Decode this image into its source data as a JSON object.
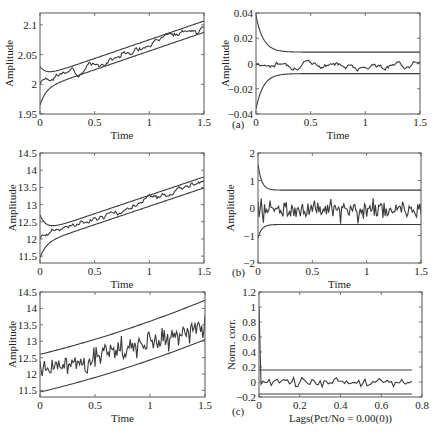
{
  "chart_data": [
    {
      "id": "a-left",
      "type": "line",
      "panel_label": "",
      "xlabel": "Time",
      "ylabel": "Amplitude",
      "xlim": [
        0,
        1.5
      ],
      "ylim": [
        1.95,
        2.12
      ],
      "xticks": [
        0,
        0.5,
        1,
        1.5
      ],
      "xtick_labels": [
        "0",
        "0.5",
        "1",
        "1.5"
      ],
      "yticks": [
        1.95,
        2,
        2.05,
        2.1
      ],
      "ytick_labels": [
        "1.95",
        "2",
        "2.05",
        "2.1"
      ],
      "grid": false,
      "frame": {
        "x": 40,
        "y": 13,
        "w": 164,
        "h": 101
      },
      "series": [
        {
          "name": "upper bound",
          "kind": "bound_upper",
          "start": 2.03,
          "min": 2.017,
          "slope": 0.063,
          "base": 2.012,
          "decay": 18
        },
        {
          "name": "estimate",
          "kind": "trend_noise",
          "start": 2.0,
          "base": 2.003,
          "slope": 0.063,
          "noise": 0.003,
          "seed": 3,
          "n": 150
        },
        {
          "name": "lower bound",
          "kind": "bound_lower",
          "start": 1.965,
          "base": 1.993,
          "slope": 0.063,
          "decay": 18
        }
      ]
    },
    {
      "id": "a-right",
      "type": "line",
      "panel_label": "(a)",
      "xlabel": "Time",
      "ylabel": "Amplitude",
      "xlim": [
        0,
        1.5
      ],
      "ylim": [
        -0.04,
        0.04
      ],
      "xticks": [
        0,
        0.5,
        1,
        1.5
      ],
      "xtick_labels": [
        "0",
        "0.5",
        "1",
        "1.5"
      ],
      "yticks": [
        -0.04,
        -0.02,
        0,
        0.02,
        0.04
      ],
      "ytick_labels": [
        "-0.04",
        "-0.02",
        "0",
        "0.02",
        "0.04"
      ],
      "grid": false,
      "frame": {
        "x": 256,
        "y": 13,
        "w": 164,
        "h": 101
      },
      "series": [
        {
          "name": "upper bound",
          "kind": "bound_upper",
          "start": 0.038,
          "base": 0.009,
          "slope": 0,
          "decay": 15
        },
        {
          "name": "residual",
          "kind": "walk",
          "base": 0.0,
          "slope": 0,
          "noise": 0.0012,
          "seed": 7,
          "n": 150,
          "clip": 0.006
        },
        {
          "name": "lower bound",
          "kind": "bound_lower",
          "start": -0.036,
          "base": -0.008,
          "slope": 0,
          "decay": 15
        }
      ]
    },
    {
      "id": "b-left",
      "type": "line",
      "panel_label": "",
      "xlabel": "Time",
      "ylabel": "Amplitude",
      "xlim": [
        0,
        1.5
      ],
      "ylim": [
        11.3,
        14.5
      ],
      "xticks": [
        0,
        0.5,
        1,
        1.5
      ],
      "xtick_labels": [
        "0",
        "0.5",
        "1",
        "1.5"
      ],
      "yticks": [
        11.5,
        12,
        12.5,
        13,
        13.5,
        14,
        14.5
      ],
      "ytick_labels": [
        "11.5",
        "12",
        "12.5",
        "13",
        "13.5",
        "14",
        "14.5"
      ],
      "grid": false,
      "frame": {
        "x": 40,
        "y": 153,
        "w": 164,
        "h": 110
      },
      "series": [
        {
          "name": "upper bound",
          "kind": "bound_upper",
          "start": 12.7,
          "base": 12.2,
          "slope": 1.07,
          "decay": 18
        },
        {
          "name": "estimate",
          "kind": "trend_noise",
          "start": 12.0,
          "base": 12.07,
          "slope": 1.05,
          "noise": 0.05,
          "seed": 11,
          "n": 150
        },
        {
          "name": "lower bound",
          "kind": "bound_lower",
          "start": 11.45,
          "base": 11.88,
          "slope": 1.07,
          "decay": 18
        }
      ]
    },
    {
      "id": "b-right",
      "type": "line",
      "panel_label": "(b)",
      "xlabel": "Time",
      "ylabel": "Amplitude",
      "xlim": [
        0,
        1.5
      ],
      "ylim": [
        -2,
        2
      ],
      "xticks": [
        0,
        0.5,
        1,
        1.5
      ],
      "xtick_labels": [
        "0",
        "0.5",
        "1",
        "1.5"
      ],
      "yticks": [
        -2,
        -1,
        0,
        1,
        2
      ],
      "ytick_labels": [
        "-2",
        "-1",
        "0",
        "1",
        "2"
      ],
      "grid": false,
      "frame": {
        "x": 258,
        "y": 153,
        "w": 163,
        "h": 110
      },
      "series": [
        {
          "name": "upper bound",
          "kind": "bound_upper",
          "start": 1.6,
          "base": 0.65,
          "slope": 0,
          "decay": 30
        },
        {
          "name": "residual",
          "kind": "white",
          "base": -0.05,
          "slope": 0,
          "noise": 0.28,
          "seed": 19,
          "n": 150
        },
        {
          "name": "lower bound",
          "kind": "bound_lower",
          "start": -1.1,
          "base": -0.6,
          "slope": 0,
          "decay": 30
        }
      ]
    },
    {
      "id": "c-left",
      "type": "line",
      "panel_label": "",
      "xlabel": "Time",
      "ylabel": "Amplitude",
      "xlim": [
        0,
        1.5
      ],
      "ylim": [
        11.3,
        14.5
      ],
      "xticks": [
        0,
        0.5,
        1,
        1.5
      ],
      "xtick_labels": [
        "0",
        "0.5",
        "1",
        "1.5"
      ],
      "yticks": [
        11.5,
        12,
        12.5,
        13,
        13.5,
        14,
        14.5
      ],
      "ytick_labels": [
        "11.5",
        "12",
        "12.5",
        "13",
        "13.5",
        "14",
        "14.5"
      ],
      "grid": false,
      "frame": {
        "x": 40,
        "y": 292,
        "w": 165,
        "h": 105
      },
      "series": [
        {
          "name": "upper bound",
          "kind": "line",
          "y0": 12.6,
          "y1": 14.25,
          "curve": 0.25
        },
        {
          "name": "measured",
          "kind": "trend_noise_white",
          "base": 12.05,
          "slope": 0.95,
          "noise": 0.27,
          "seed": 23,
          "n": 150
        },
        {
          "name": "lower bound",
          "kind": "line",
          "y0": 11.45,
          "y1": 13.05,
          "curve": 0.25
        }
      ]
    },
    {
      "id": "c-right",
      "type": "line",
      "panel_label": "(c)",
      "xlabel": "Lags(Pct/No = 0.00(0))",
      "ylabel": "Norm. corr.",
      "xlim": [
        0,
        0.8
      ],
      "ylim": [
        -0.2,
        1.2
      ],
      "xticks": [
        0,
        0.2,
        0.4,
        0.6,
        0.8
      ],
      "xtick_labels": [
        "0",
        "0.2",
        "0.4",
        "0.6",
        "0.8"
      ],
      "yticks": [
        -0.2,
        0,
        0.2,
        0.4,
        0.6,
        0.8,
        1,
        1.2
      ],
      "ytick_labels": [
        "-0.2",
        "0",
        "0.2",
        "0.4",
        "0.6",
        "0.8",
        "1",
        "1.2"
      ],
      "grid": false,
      "frame": {
        "x": 259,
        "y": 292,
        "w": 163,
        "h": 105
      },
      "series": [
        {
          "name": "upper confidence",
          "kind": "hline",
          "y": 0.16,
          "x0": 0,
          "x1": 0.75
        },
        {
          "name": "autocorrelation",
          "kind": "acf",
          "peak": 1.0,
          "noise": 0.04,
          "seed": 31,
          "n": 75,
          "x1": 0.75
        },
        {
          "name": "lower confidence",
          "kind": "hline",
          "y": -0.16,
          "x0": 0,
          "x1": 0.75
        }
      ]
    }
  ],
  "panel_labels": {
    "a": "(a)",
    "b": "(b)",
    "c": "(c)"
  },
  "colors": {
    "line": "#3a3a3a",
    "frame": "#555555",
    "background": "#ffffff"
  }
}
